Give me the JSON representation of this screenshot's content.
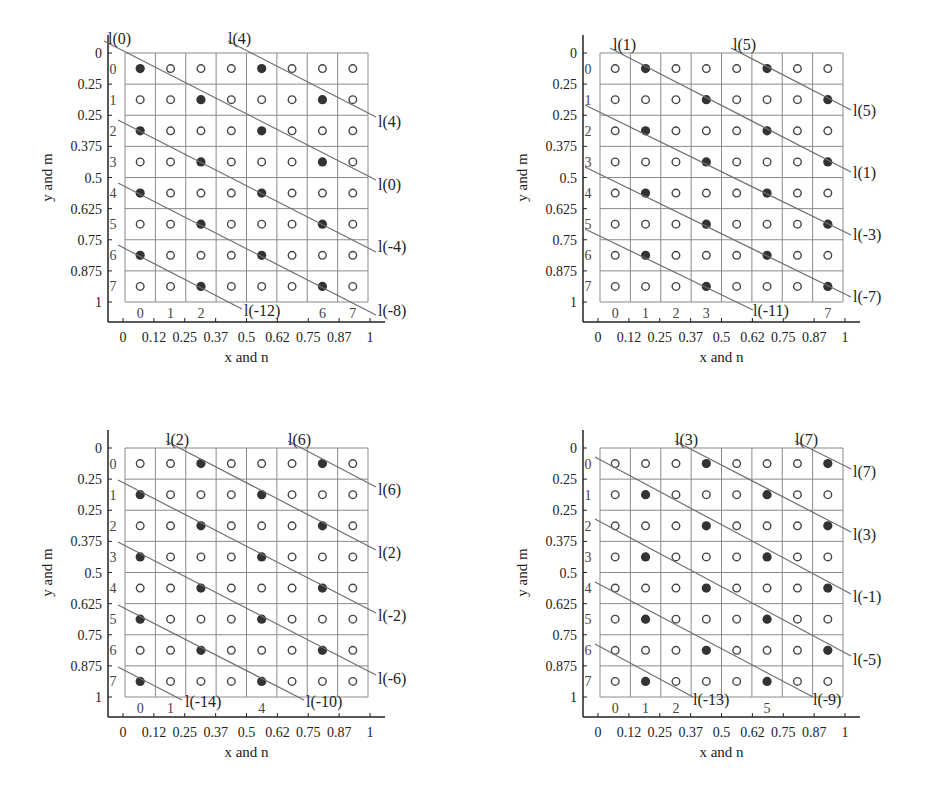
{
  "chart_data": [
    {
      "type": "scatter",
      "title": "",
      "xlabel": "x and n",
      "ylabel": "y and m",
      "xtick_labels": [
        "0",
        "0.12",
        "0.25",
        "0.37",
        "0.5",
        "0.62",
        "0.75",
        "0.87",
        "1"
      ],
      "ytick_labels": [
        "0",
        "0.25",
        "0.25",
        "0.375",
        "0.5",
        "0.625",
        "0.75",
        "0.875",
        "1"
      ],
      "grid": "8x8",
      "row_labels": [
        "0",
        "1",
        "2",
        "3",
        "4",
        "5",
        "6",
        "7"
      ],
      "col_labels": [
        "0",
        "1",
        "2",
        "",
        "",
        "",
        "6",
        "7"
      ],
      "filled_points": [
        [
          0,
          0
        ],
        [
          0,
          4
        ],
        [
          1,
          2
        ],
        [
          1,
          6
        ],
        [
          2,
          0
        ],
        [
          2,
          4
        ],
        [
          3,
          2
        ],
        [
          3,
          6
        ],
        [
          4,
          0
        ],
        [
          4,
          4
        ],
        [
          5,
          2
        ],
        [
          5,
          6
        ],
        [
          6,
          0
        ],
        [
          6,
          4
        ],
        [
          7,
          2
        ],
        [
          7,
          6
        ]
      ],
      "lines": [
        {
          "label_top": "l(0)",
          "label_end": "l(0)",
          "start": [
            -0.5,
            -0.5
          ],
          "end_label_pos": "right"
        },
        {
          "label_top": "l(4)",
          "label_end": "l(4)"
        },
        {
          "label_end": "l(-4)"
        },
        {
          "label_end": "l(-8)"
        },
        {
          "label_end": "l(-12)"
        }
      ],
      "line_labels": [
        "l(0)",
        "l(4)",
        "l(4)",
        "l(0)",
        "l(-4)",
        "l(-8)",
        "l(-12)"
      ]
    },
    {
      "type": "scatter",
      "title": "",
      "xlabel": "x and n",
      "ylabel": "y and m",
      "xtick_labels": [
        "0",
        "0.12",
        "0.25",
        "0.37",
        "0.5",
        "0.62",
        "0.75",
        "0.87",
        "1"
      ],
      "ytick_labels": [
        "0",
        "0.25",
        "0.25",
        "0.375",
        "0.5",
        "0.625",
        "0.75",
        "0.875",
        "1"
      ],
      "grid": "8x8",
      "row_labels": [
        "0",
        "1",
        "2",
        "3",
        "4",
        "5",
        "6",
        "7"
      ],
      "col_labels": [
        "0",
        "1",
        "2",
        "3",
        "",
        "",
        "",
        "7"
      ],
      "filled_points": [
        [
          0,
          1
        ],
        [
          0,
          5
        ],
        [
          1,
          3
        ],
        [
          1,
          7
        ],
        [
          2,
          1
        ],
        [
          2,
          5
        ],
        [
          3,
          3
        ],
        [
          3,
          7
        ],
        [
          4,
          1
        ],
        [
          4,
          5
        ],
        [
          5,
          3
        ],
        [
          5,
          7
        ],
        [
          6,
          1
        ],
        [
          6,
          5
        ],
        [
          7,
          3
        ],
        [
          7,
          7
        ]
      ],
      "line_labels": [
        "l(1)",
        "l(5)",
        "l(5)",
        "l(1)",
        "l(-3)",
        "l(-7)",
        "l(-11)"
      ]
    },
    {
      "type": "scatter",
      "title": "",
      "xlabel": "x and n",
      "ylabel": "y and m",
      "xtick_labels": [
        "0",
        "0.12",
        "0.25",
        "0.37",
        "0.5",
        "0.62",
        "0.75",
        "0.87",
        "1"
      ],
      "ytick_labels": [
        "0",
        "0.25",
        "0.25",
        "0.375",
        "0.5",
        "0.625",
        "0.75",
        "0.875",
        "1"
      ],
      "grid": "8x8",
      "row_labels": [
        "0",
        "1",
        "2",
        "3",
        "4",
        "5",
        "6",
        "7"
      ],
      "col_labels": [
        "0",
        "1",
        "",
        "",
        "4",
        "",
        "",
        ""
      ],
      "filled_points": [
        [
          0,
          2
        ],
        [
          0,
          6
        ],
        [
          1,
          0
        ],
        [
          1,
          4
        ],
        [
          2,
          2
        ],
        [
          2,
          6
        ],
        [
          3,
          0
        ],
        [
          3,
          4
        ],
        [
          4,
          2
        ],
        [
          4,
          6
        ],
        [
          5,
          0
        ],
        [
          5,
          4
        ],
        [
          6,
          2
        ],
        [
          6,
          6
        ],
        [
          7,
          0
        ],
        [
          7,
          4
        ]
      ],
      "line_labels": [
        "l(2)",
        "l(6)",
        "l(6)",
        "l(2)",
        "l(-2)",
        "l(-6)",
        "l(-10)",
        "l(-14)"
      ]
    },
    {
      "type": "scatter",
      "title": "",
      "xlabel": "x and n",
      "ylabel": "y and m",
      "xtick_labels": [
        "0",
        "0.12",
        "0.25",
        "0.37",
        "0.5",
        "0.62",
        "0.75",
        "0.87",
        "1"
      ],
      "ytick_labels": [
        "0",
        "0.25",
        "0.25",
        "0.375",
        "0.5",
        "0.625",
        "0.75",
        "0.875",
        "1"
      ],
      "grid": "8x8",
      "row_labels": [
        "0",
        "1",
        "2",
        "3",
        "4",
        "5",
        "6",
        "7"
      ],
      "col_labels": [
        "0",
        "1",
        "2",
        "",
        "",
        "5",
        "",
        ""
      ],
      "filled_points": [
        [
          0,
          3
        ],
        [
          0,
          7
        ],
        [
          1,
          1
        ],
        [
          1,
          5
        ],
        [
          2,
          3
        ],
        [
          2,
          7
        ],
        [
          3,
          1
        ],
        [
          3,
          5
        ],
        [
          4,
          3
        ],
        [
          4,
          7
        ],
        [
          5,
          1
        ],
        [
          5,
          5
        ],
        [
          6,
          3
        ],
        [
          6,
          7
        ],
        [
          7,
          1
        ],
        [
          7,
          5
        ]
      ],
      "line_labels": [
        "l(3)",
        "l(7)",
        "l(7)",
        "l(3)",
        "l(-1)",
        "l(-5)",
        "l(-9)",
        "l(-13)"
      ]
    }
  ],
  "panels": [
    {
      "id": "panel-1",
      "ox": 0,
      "oy": 0,
      "filled": [
        [
          0,
          0
        ],
        [
          0,
          4
        ],
        [
          1,
          2
        ],
        [
          1,
          6
        ],
        [
          2,
          0
        ],
        [
          2,
          4
        ],
        [
          3,
          2
        ],
        [
          3,
          6
        ],
        [
          4,
          0
        ],
        [
          4,
          4
        ],
        [
          5,
          2
        ],
        [
          5,
          6
        ],
        [
          6,
          0
        ],
        [
          6,
          4
        ],
        [
          7,
          2
        ],
        [
          7,
          6
        ]
      ],
      "col_labels": [
        "0",
        "1",
        "2",
        "",
        "",
        "",
        "6",
        "7"
      ],
      "row_labels": [
        "0",
        "1",
        "2",
        "3",
        "4",
        "5",
        "6",
        "7"
      ],
      "row_label_shift": [
        0,
        0,
        0,
        0,
        0,
        0,
        0,
        0
      ],
      "lines": [
        {
          "x1": 104,
          "y1": 41,
          "x2": 376,
          "y2": 180,
          "label": "l(0)",
          "lx": 378,
          "ly": 190
        },
        {
          "x1": 228,
          "y1": 41,
          "x2": 376,
          "y2": 117,
          "label": "l(4)",
          "lx": 378,
          "ly": 127
        },
        {
          "x1": 118,
          "y1": 120,
          "x2": 376,
          "y2": 252,
          "label": "l(-4)",
          "lx": 378,
          "ly": 252
        },
        {
          "x1": 118,
          "y1": 183,
          "x2": 376,
          "y2": 315,
          "label": "l(-8)",
          "lx": 378,
          "ly": 316
        },
        {
          "x1": 118,
          "y1": 245,
          "x2": 242,
          "y2": 309,
          "label": "l(-12)",
          "lx": 244,
          "ly": 316
        }
      ],
      "top_labels": [
        {
          "text": "l(0)",
          "x": 108,
          "y": 44
        },
        {
          "text": "l(4)",
          "x": 228,
          "y": 44
        }
      ]
    },
    {
      "id": "panel-2",
      "ox": 475,
      "oy": 0,
      "filled": [
        [
          0,
          1
        ],
        [
          0,
          5
        ],
        [
          1,
          3
        ],
        [
          1,
          7
        ],
        [
          2,
          1
        ],
        [
          2,
          5
        ],
        [
          3,
          3
        ],
        [
          3,
          7
        ],
        [
          4,
          1
        ],
        [
          4,
          5
        ],
        [
          5,
          3
        ],
        [
          5,
          7
        ],
        [
          6,
          1
        ],
        [
          6,
          5
        ],
        [
          7,
          3
        ],
        [
          7,
          7
        ]
      ],
      "col_labels": [
        "0",
        "1",
        "2",
        "3",
        "",
        "",
        "",
        "7"
      ],
      "row_labels": [
        "0",
        "1",
        "2",
        "3",
        "4",
        "5",
        "6",
        "7"
      ],
      "lines": [
        {
          "x1": 135,
          "y1": 48,
          "x2": 376,
          "y2": 172,
          "label": "l(1)",
          "lx": 378,
          "ly": 178
        },
        {
          "x1": 256,
          "y1": 48,
          "x2": 376,
          "y2": 110,
          "label": "l(5)",
          "lx": 378,
          "ly": 116
        },
        {
          "x1": 110,
          "y1": 105,
          "x2": 376,
          "y2": 235,
          "label": "l(-3)",
          "lx": 378,
          "ly": 240
        },
        {
          "x1": 110,
          "y1": 167,
          "x2": 376,
          "y2": 297,
          "label": "l(-7)",
          "lx": 378,
          "ly": 302
        },
        {
          "x1": 110,
          "y1": 229,
          "x2": 278,
          "y2": 310,
          "label": "l(-11)",
          "lx": 278,
          "ly": 316
        }
      ],
      "top_labels": [
        {
          "text": "l(1)",
          "x": 138,
          "y": 50
        },
        {
          "text": "l(5)",
          "x": 258,
          "y": 50
        }
      ]
    },
    {
      "id": "panel-3",
      "ox": 0,
      "oy": 395,
      "filled": [
        [
          0,
          2
        ],
        [
          0,
          6
        ],
        [
          1,
          0
        ],
        [
          1,
          4
        ],
        [
          2,
          2
        ],
        [
          2,
          6
        ],
        [
          3,
          0
        ],
        [
          3,
          4
        ],
        [
          4,
          2
        ],
        [
          4,
          6
        ],
        [
          5,
          0
        ],
        [
          5,
          4
        ],
        [
          6,
          2
        ],
        [
          6,
          6
        ],
        [
          7,
          0
        ],
        [
          7,
          4
        ]
      ],
      "col_labels": [
        "0",
        "1",
        "",
        "",
        "4",
        "",
        "",
        ""
      ],
      "row_labels": [
        "0",
        "1",
        "2",
        "3",
        "4",
        "5",
        "6",
        "7"
      ],
      "lines": [
        {
          "x1": 166,
          "y1": 46,
          "x2": 376,
          "y2": 155,
          "label": "l(2)",
          "lx": 378,
          "ly": 163
        },
        {
          "x1": 288,
          "y1": 46,
          "x2": 376,
          "y2": 92,
          "label": "l(6)",
          "lx": 378,
          "ly": 100
        },
        {
          "x1": 118,
          "y1": 85,
          "x2": 376,
          "y2": 218,
          "label": "l(-2)",
          "lx": 378,
          "ly": 226
        },
        {
          "x1": 118,
          "y1": 147,
          "x2": 376,
          "y2": 280,
          "label": "l(-6)",
          "lx": 378,
          "ly": 289
        },
        {
          "x1": 118,
          "y1": 210,
          "x2": 304,
          "y2": 305,
          "label": "l(-10)",
          "lx": 306,
          "ly": 312
        },
        {
          "x1": 118,
          "y1": 272,
          "x2": 182,
          "y2": 305,
          "label": "l(-14)",
          "lx": 185,
          "ly": 312
        }
      ],
      "top_labels": [
        {
          "text": "l(2)",
          "x": 166,
          "y": 50
        },
        {
          "text": "l(6)",
          "x": 288,
          "y": 50
        }
      ]
    },
    {
      "id": "panel-4",
      "ox": 475,
      "oy": 395,
      "filled": [
        [
          0,
          3
        ],
        [
          0,
          7
        ],
        [
          1,
          1
        ],
        [
          1,
          5
        ],
        [
          2,
          3
        ],
        [
          2,
          7
        ],
        [
          3,
          1
        ],
        [
          3,
          5
        ],
        [
          4,
          3
        ],
        [
          4,
          7
        ],
        [
          5,
          1
        ],
        [
          5,
          5
        ],
        [
          6,
          3
        ],
        [
          6,
          7
        ],
        [
          7,
          1
        ],
        [
          7,
          5
        ]
      ],
      "col_labels": [
        "0",
        "1",
        "2",
        "",
        "",
        "5",
        "",
        ""
      ],
      "row_labels": [
        "0",
        "1",
        "2",
        "3",
        "4",
        "5",
        "6",
        "7"
      ],
      "lines": [
        {
          "x1": 200,
          "y1": 46,
          "x2": 376,
          "y2": 137,
          "label": "l(3)",
          "lx": 378,
          "ly": 145
        },
        {
          "x1": 320,
          "y1": 46,
          "x2": 376,
          "y2": 74,
          "label": "l(7)",
          "lx": 378,
          "ly": 82
        },
        {
          "x1": 120,
          "y1": 62,
          "x2": 376,
          "y2": 199,
          "label": "l(-1)",
          "lx": 378,
          "ly": 207
        },
        {
          "x1": 120,
          "y1": 124,
          "x2": 376,
          "y2": 261,
          "label": "l(-5)",
          "lx": 378,
          "ly": 270
        },
        {
          "x1": 120,
          "y1": 187,
          "x2": 338,
          "y2": 302,
          "label": "l(-9)",
          "lx": 338,
          "ly": 310
        },
        {
          "x1": 120,
          "y1": 249,
          "x2": 218,
          "y2": 302,
          "label": "l(-13)",
          "lx": 218,
          "ly": 310
        }
      ],
      "top_labels": [
        {
          "text": "l(3)",
          "x": 200,
          "y": 50
        },
        {
          "text": "l(7)",
          "x": 320,
          "y": 50
        }
      ]
    }
  ],
  "axes": {
    "xlabel": "x and n",
    "ylabel": "y and m",
    "xtick_labels": [
      "0",
      "0.12",
      "0.25",
      "0.37",
      "0.5",
      "0.62",
      "0.75",
      "0.87",
      "1"
    ],
    "ytick_labels": [
      "0",
      "0.25",
      "0.25",
      "0.375",
      "0.5",
      "0.625",
      "0.75",
      "0.875",
      "1"
    ]
  },
  "colors": {
    "grid": "#8a8a8a",
    "axis": "#222222",
    "filled_dot": "#333333",
    "open_dot": "#444444",
    "diag_line": "#6e6e6e",
    "text": "#222222"
  }
}
